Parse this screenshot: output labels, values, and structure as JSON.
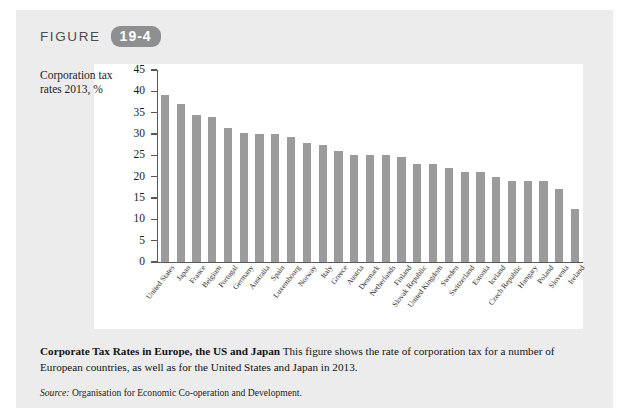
{
  "figure": {
    "label": "FIGURE",
    "number": "19-4"
  },
  "chart_data": {
    "type": "bar",
    "title": "Corporate Tax Rates in Europe, the US and Japan",
    "ylabel": "Corporation tax rates 2013, %",
    "xlabel": "",
    "ylim": [
      0,
      45
    ],
    "ytick_step": 5,
    "yticks": [
      0,
      5,
      10,
      15,
      20,
      25,
      30,
      35,
      40,
      45
    ],
    "grid": false,
    "legend": "none",
    "bar_color": "#9b9b9d",
    "categories": [
      "United States",
      "Japan",
      "France",
      "Belgium",
      "Portugal",
      "Germany",
      "Australia",
      "Spain",
      "Luxembourg",
      "Norway",
      "Italy",
      "Greece",
      "Austria",
      "Denmark",
      "Netherlands",
      "Finland",
      "Slovak Republic",
      "United Kingdom",
      "Sweden",
      "Switzerland",
      "Estonia",
      "Iceland",
      "Czech Republic",
      "Hungary",
      "Poland",
      "Slovenia",
      "Ireland"
    ],
    "values": [
      39.1,
      37.0,
      34.4,
      34.0,
      31.5,
      30.2,
      30.0,
      30.0,
      29.2,
      28.0,
      27.5,
      26.0,
      25.0,
      25.0,
      25.0,
      24.5,
      23.0,
      23.0,
      22.0,
      21.1,
      21.0,
      20.0,
      19.0,
      19.0,
      19.0,
      17.0,
      12.5
    ]
  },
  "caption": {
    "bold_title": "Corporate Tax Rates in Europe, the US and Japan",
    "body": " This figure shows the rate of corporation tax for a number of European countries, as well as for the United States and Japan in 2013."
  },
  "source": {
    "label": "Source:",
    "text": " Organisation for Economic Co-operation and Development."
  }
}
